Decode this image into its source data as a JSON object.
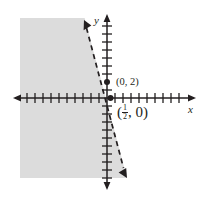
{
  "figure": {
    "kind": "coordinate-plane-inequality-graph",
    "background_color": "#ffffff",
    "axis_color": "#231f20",
    "line_color": "#231f20",
    "shade_color": "#dcdcdc"
  },
  "axes": {
    "x_label": "x",
    "y_label": "y",
    "x_axis": {
      "y_pixel": 98,
      "start_x": 13,
      "end_x": 196,
      "tick_count": 21,
      "tick_spacing": 8
    },
    "y_axis": {
      "x_pixel": 107,
      "start_y": 14,
      "end_y": 190,
      "tick_count": 21,
      "tick_spacing": 8
    },
    "origin": {
      "x": 107,
      "y": 98
    }
  },
  "boundary_line": {
    "style": "dashed",
    "arrow_start": {
      "x": 84,
      "y": 21
    },
    "arrow_end": {
      "x": 126,
      "y": 177
    },
    "dash_pattern": "5 4",
    "stroke_width": 1.7
  },
  "shaded_region": {
    "description": "left of dashed boundary line",
    "left": 20,
    "top": 18,
    "bottom": 178
  },
  "points": [
    {
      "name": "y-intercept",
      "label": "(0, 2)",
      "label_open": "(0, 2)",
      "x_pixel": 107,
      "y_pixel": 82
    },
    {
      "name": "x-intercept",
      "label": "(1/2, 0)",
      "fraction_numerator": "1",
      "fraction_denominator": "2",
      "label_prefix": "(",
      "label_suffix": ", 0)",
      "x_pixel": 110,
      "y_pixel": 98
    }
  ]
}
